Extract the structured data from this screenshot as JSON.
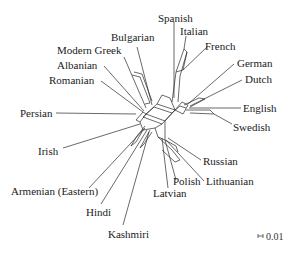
{
  "diagram": {
    "type": "phylogenetic-network",
    "taxa": [
      {
        "id": "spanish",
        "label": "Spanish",
        "x": 172,
        "y": 13
      },
      {
        "id": "italian",
        "label": "Italian",
        "x": 181,
        "y": 26
      },
      {
        "id": "french",
        "label": "French",
        "x": 205,
        "y": 41
      },
      {
        "id": "german",
        "label": "German",
        "x": 237,
        "y": 58
      },
      {
        "id": "dutch",
        "label": "Dutch",
        "x": 245,
        "y": 73
      },
      {
        "id": "english",
        "label": "English",
        "x": 243,
        "y": 102
      },
      {
        "id": "swedish",
        "label": "Swedish",
        "x": 233,
        "y": 121
      },
      {
        "id": "russian",
        "label": "Russian",
        "x": 203,
        "y": 156
      },
      {
        "id": "lithuanian",
        "label": "Lithuanian",
        "x": 206,
        "y": 175
      },
      {
        "id": "polish",
        "label": "Polish",
        "x": 173,
        "y": 175
      },
      {
        "id": "latvian",
        "label": "Latvian",
        "x": 153,
        "y": 187
      },
      {
        "id": "kashmiri",
        "label": "Kashmiri",
        "x": 108,
        "y": 228
      },
      {
        "id": "hindi",
        "label": "Hindi",
        "x": 86,
        "y": 206
      },
      {
        "id": "armenian",
        "label": "Armenian (Eastern)",
        "x": 11,
        "y": 185
      },
      {
        "id": "irish",
        "label": "Irish",
        "x": 38,
        "y": 145
      },
      {
        "id": "persian",
        "label": "Persian",
        "x": 20,
        "y": 107
      },
      {
        "id": "romanian",
        "label": "Romanian",
        "x": 49,
        "y": 74
      },
      {
        "id": "albanian",
        "label": "Albanian",
        "x": 57,
        "y": 59
      },
      {
        "id": "modern_greek",
        "label": "Modern Greek",
        "x": 57,
        "y": 44
      },
      {
        "id": "bulgarian",
        "label": "Bulgarian",
        "x": 111,
        "y": 31
      }
    ],
    "scale_bar": {
      "label": "0.01",
      "x": 266,
      "y": 231
    }
  }
}
